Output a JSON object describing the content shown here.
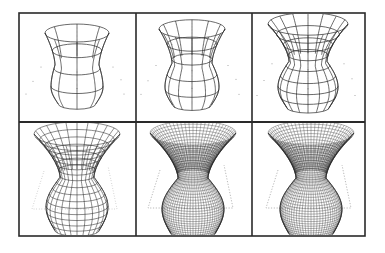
{
  "figure": {
    "background": "#ffffff",
    "frame_color": "#2a2a2a",
    "line_color": "#2b2b2b",
    "dot_color": "#8a8a8a",
    "outer": {
      "x": 19,
      "y": 13,
      "w": 346,
      "h": 223
    },
    "col_dividers": [
      136,
      252
    ],
    "row_divider": 122,
    "panels": [
      {
        "id": "p1",
        "row": 0,
        "col": 0,
        "meridians": 8,
        "rings": 4,
        "shape": "coarse",
        "cx": 77,
        "top": 33,
        "rimR": 32,
        "waistR": 22,
        "bulgeR": 26,
        "bottom": 104,
        "trapezoid": false
      },
      {
        "id": "p2",
        "row": 0,
        "col": 1,
        "meridians": 12,
        "rings": 5,
        "shape": "coarse",
        "cx": 192,
        "top": 29,
        "rimR": 33,
        "waistR": 20,
        "bulgeR": 27,
        "bottom": 105,
        "trapezoid": false
      },
      {
        "id": "p3",
        "row": 0,
        "col": 2,
        "meridians": 16,
        "rings": 8,
        "shape": "medium",
        "cx": 308,
        "top": 24,
        "rimR": 40,
        "waistR": 19,
        "bulgeR": 30,
        "bottom": 107,
        "trapezoid": false
      },
      {
        "id": "p4",
        "row": 1,
        "col": 0,
        "meridians": 24,
        "rings": 16,
        "shape": "fine",
        "cx": 77,
        "top": 134,
        "rimR": 43,
        "waistR": 17,
        "bulgeR": 31,
        "bottom": 230,
        "trapezoid": "dotted"
      },
      {
        "id": "p5",
        "row": 1,
        "col": 1,
        "meridians": 64,
        "rings": 40,
        "shape": "dense",
        "cx": 193,
        "top": 133,
        "rimR": 43,
        "waistR": 15,
        "bulgeR": 31,
        "bottom": 233,
        "trapezoid": "dashed"
      },
      {
        "id": "p6",
        "row": 1,
        "col": 2,
        "meridians": 64,
        "rings": 40,
        "shape": "dense",
        "cx": 311,
        "top": 133,
        "rimR": 43,
        "waistR": 15,
        "bulgeR": 31,
        "bottom": 233,
        "trapezoid": "dashed"
      }
    ]
  }
}
